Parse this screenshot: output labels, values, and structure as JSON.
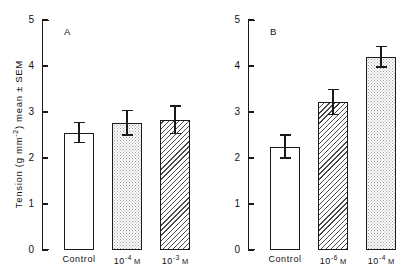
{
  "figure": {
    "y_axis_title": "Tension (g mm",
    "y_axis_title_sup": "-2",
    "y_axis_title_tail": ") mean ± SEM",
    "y_ticks": [
      "0",
      "1",
      "2",
      "3",
      "4",
      "5"
    ],
    "panels": [
      {
        "letter": "A",
        "categories": [
          "Control",
          "10⁻⁴ M",
          "10⁻³ M"
        ],
        "cat_parts": [
          {
            "base": "Control",
            "sup": "",
            "unit": ""
          },
          {
            "base": "10",
            "sup": "-4",
            "unit": "M"
          },
          {
            "base": "10",
            "sup": "-3",
            "unit": "M"
          }
        ],
        "values": [
          2.55,
          2.77,
          2.83
        ],
        "errors": [
          0.22,
          0.27,
          0.3
        ],
        "fills": [
          "open",
          "stipple",
          "hatch"
        ]
      },
      {
        "letter": "B",
        "categories": [
          "Control",
          "10⁻⁶ M",
          "10⁻⁴ M"
        ],
        "cat_parts": [
          {
            "base": "Control",
            "sup": "",
            "unit": ""
          },
          {
            "base": "10",
            "sup": "-6",
            "unit": "M"
          },
          {
            "base": "10",
            "sup": "-4",
            "unit": "M"
          }
        ],
        "values": [
          2.25,
          3.22,
          4.2
        ],
        "errors": [
          0.25,
          0.27,
          0.22
        ],
        "fills": [
          "open",
          "hatch",
          "stipple"
        ]
      }
    ]
  },
  "chart_data": {
    "type": "bar",
    "title": "",
    "subtitle": "",
    "xlabel": "",
    "ylabel": "Tension (g mm⁻²) mean ± SEM",
    "ylim": [
      0,
      5
    ],
    "ytick_values": [
      0,
      1,
      2,
      3,
      4,
      5
    ],
    "grid": false,
    "legend": "none",
    "error_bars": "SEM",
    "panels": [
      {
        "panel_label": "A",
        "categories": [
          "Control",
          "10⁻⁴ M",
          "10⁻³ M"
        ],
        "values": [
          2.55,
          2.77,
          2.83
        ],
        "errors": [
          0.22,
          0.27,
          0.3
        ],
        "bar_fills": [
          "open",
          "stipple",
          "diagonal-hatch"
        ]
      },
      {
        "panel_label": "B",
        "categories": [
          "Control",
          "10⁻⁶ M",
          "10⁻⁴ M"
        ],
        "values": [
          2.25,
          3.22,
          4.2
        ],
        "errors": [
          0.25,
          0.27,
          0.22
        ],
        "bar_fills": [
          "open",
          "diagonal-hatch",
          "stipple"
        ]
      }
    ]
  }
}
